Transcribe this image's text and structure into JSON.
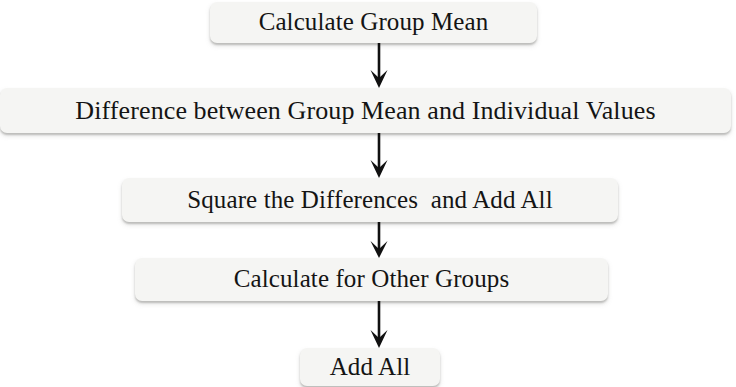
{
  "diagram": {
    "orientation": "vertical-top-to-bottom",
    "background_color": "#ffffff",
    "node_fill_color": "#f5f5f3",
    "text_color": "#141414",
    "arrow_color": "#111111",
    "nodes": [
      {
        "id": "node-1",
        "label": "Calculate Group Mean"
      },
      {
        "id": "node-2",
        "label": "Difference between Group Mean and Individual Values"
      },
      {
        "id": "node-3",
        "label": "Square the Differences  and Add All"
      },
      {
        "id": "node-4",
        "label": "Calculate for Other Groups"
      },
      {
        "id": "node-5",
        "label": "Add All"
      }
    ],
    "connectors": [
      {
        "id": "arrow-1",
        "from": "node-1",
        "to": "node-2",
        "glyph": "down-arrow"
      },
      {
        "id": "arrow-2",
        "from": "node-2",
        "to": "node-3",
        "glyph": "down-arrow"
      },
      {
        "id": "arrow-3",
        "from": "node-3",
        "to": "node-4",
        "glyph": "down-arrow"
      },
      {
        "id": "arrow-4",
        "from": "node-4",
        "to": "node-5",
        "glyph": "down-arrow"
      }
    ]
  }
}
